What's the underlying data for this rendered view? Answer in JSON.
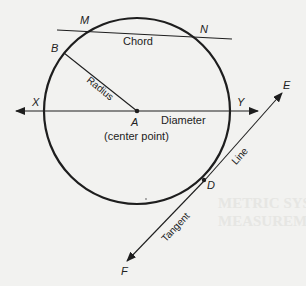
{
  "diagram": {
    "points": {
      "M": "M",
      "N": "N",
      "B": "B",
      "X": "X",
      "Y": "Y",
      "A": "A",
      "E": "E",
      "D": "D",
      "F": "F"
    },
    "labels": {
      "chord": "Chord",
      "radius": "Radius",
      "diameter": "Diameter",
      "center": "(center point)",
      "line": "Line",
      "tangent": "Tangent"
    },
    "colors": {
      "ink": "#1e1e1e",
      "background": "#f2f2f0"
    }
  },
  "bleed_through": {
    "line1": "METRIC SYSTEM AND THE",
    "line2": "MEASUREMENT"
  }
}
